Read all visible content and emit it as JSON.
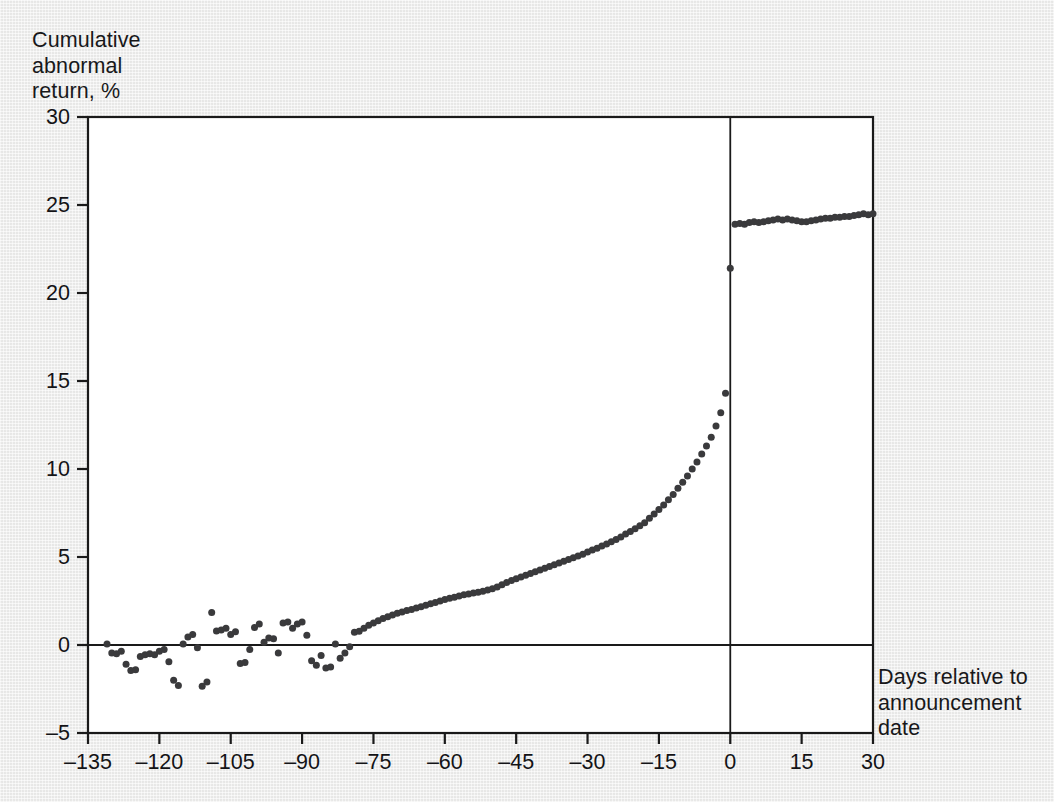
{
  "figure": {
    "background_color": "#ededec",
    "ink_color": "#1a1a1a",
    "marker_color": "#3a3a3c"
  },
  "chart_data": {
    "type": "scatter",
    "title": "",
    "subtitle": "",
    "xlabel": "Days relative to announcement date",
    "ylabel": "Cumulative abnormal return, %",
    "xlim": [
      -135,
      30
    ],
    "ylim": [
      -5,
      30
    ],
    "xticks": [
      -135,
      -120,
      -105,
      -90,
      -75,
      -60,
      -45,
      -30,
      -15,
      0,
      15,
      30
    ],
    "xtick_labels": [
      "–135",
      "–120",
      "–105",
      "–90",
      "–75",
      "–60",
      "–45",
      "–30",
      "–15",
      "0",
      "15",
      "30"
    ],
    "yticks": [
      -5,
      0,
      5,
      10,
      15,
      20,
      25,
      30
    ],
    "ytick_labels": [
      "–5",
      "0",
      "5",
      "10",
      "15",
      "20",
      "25",
      "30"
    ],
    "grid": false,
    "legend": null,
    "legend_position": "none",
    "annotations": [
      {
        "name": "zero-day-rule",
        "type": "vline",
        "x": 0
      },
      {
        "name": "zero-return-rule",
        "type": "hline",
        "y": 0
      }
    ],
    "marker_size_px": 7,
    "series": [
      {
        "name": "Cumulative abnormal return",
        "points": [
          [
            -131,
            0.05
          ],
          [
            -130,
            -0.45
          ],
          [
            -129,
            -0.5
          ],
          [
            -128,
            -0.35
          ],
          [
            -127,
            -1.1
          ],
          [
            -126,
            -1.45
          ],
          [
            -125,
            -1.4
          ],
          [
            -124,
            -0.65
          ],
          [
            -123,
            -0.55
          ],
          [
            -122,
            -0.5
          ],
          [
            -121,
            -0.55
          ],
          [
            -120,
            -0.35
          ],
          [
            -119,
            -0.25
          ],
          [
            -118,
            -0.95
          ],
          [
            -117,
            -2.0
          ],
          [
            -116,
            -2.3
          ],
          [
            -115,
            0.05
          ],
          [
            -114,
            0.45
          ],
          [
            -113,
            0.6
          ],
          [
            -112,
            -0.15
          ],
          [
            -111,
            -2.35
          ],
          [
            -110,
            -2.1
          ],
          [
            -109,
            1.85
          ],
          [
            -108,
            0.8
          ],
          [
            -107,
            0.85
          ],
          [
            -106,
            0.95
          ],
          [
            -105,
            0.6
          ],
          [
            -104,
            0.75
          ],
          [
            -103,
            -1.05
          ],
          [
            -102,
            -1.0
          ],
          [
            -101,
            -0.25
          ],
          [
            -100,
            1.0
          ],
          [
            -99,
            1.2
          ],
          [
            -98,
            0.15
          ],
          [
            -97,
            0.4
          ],
          [
            -96,
            0.35
          ],
          [
            -95,
            -0.45
          ],
          [
            -94,
            1.25
          ],
          [
            -93,
            1.3
          ],
          [
            -92,
            0.95
          ],
          [
            -91,
            1.2
          ],
          [
            -90,
            1.3
          ],
          [
            -89,
            0.55
          ],
          [
            -88,
            -0.9
          ],
          [
            -87,
            -1.15
          ],
          [
            -86,
            -0.6
          ],
          [
            -85,
            -1.3
          ],
          [
            -84,
            -1.25
          ],
          [
            -83,
            0.05
          ],
          [
            -82,
            -0.75
          ],
          [
            -81,
            -0.45
          ],
          [
            -80,
            -0.1
          ],
          [
            -79,
            0.72
          ],
          [
            -78,
            0.78
          ],
          [
            -77,
            0.95
          ],
          [
            -76,
            1.12
          ],
          [
            -75,
            1.25
          ],
          [
            -74,
            1.38
          ],
          [
            -73,
            1.5
          ],
          [
            -72,
            1.6
          ],
          [
            -71,
            1.7
          ],
          [
            -70,
            1.8
          ],
          [
            -69,
            1.88
          ],
          [
            -68,
            1.96
          ],
          [
            -67,
            2.02
          ],
          [
            -66,
            2.1
          ],
          [
            -65,
            2.18
          ],
          [
            -64,
            2.26
          ],
          [
            -63,
            2.34
          ],
          [
            -62,
            2.42
          ],
          [
            -61,
            2.5
          ],
          [
            -60,
            2.58
          ],
          [
            -59,
            2.66
          ],
          [
            -58,
            2.72
          ],
          [
            -57,
            2.78
          ],
          [
            -56,
            2.85
          ],
          [
            -55,
            2.9
          ],
          [
            -54,
            2.95
          ],
          [
            -53,
            3.0
          ],
          [
            -52,
            3.05
          ],
          [
            -51,
            3.12
          ],
          [
            -50,
            3.2
          ],
          [
            -49,
            3.3
          ],
          [
            -48,
            3.42
          ],
          [
            -47,
            3.55
          ],
          [
            -46,
            3.66
          ],
          [
            -45,
            3.76
          ],
          [
            -44,
            3.86
          ],
          [
            -43,
            3.96
          ],
          [
            -42,
            4.06
          ],
          [
            -41,
            4.16
          ],
          [
            -40,
            4.26
          ],
          [
            -39,
            4.36
          ],
          [
            -38,
            4.46
          ],
          [
            -37,
            4.56
          ],
          [
            -36,
            4.66
          ],
          [
            -35,
            4.76
          ],
          [
            -34,
            4.86
          ],
          [
            -33,
            4.96
          ],
          [
            -32,
            5.06
          ],
          [
            -31,
            5.16
          ],
          [
            -30,
            5.28
          ],
          [
            -29,
            5.4
          ],
          [
            -28,
            5.5
          ],
          [
            -27,
            5.62
          ],
          [
            -26,
            5.74
          ],
          [
            -25,
            5.86
          ],
          [
            -24,
            6.0
          ],
          [
            -23,
            6.14
          ],
          [
            -22,
            6.3
          ],
          [
            -21,
            6.45
          ],
          [
            -20,
            6.6
          ],
          [
            -19,
            6.78
          ],
          [
            -18,
            6.95
          ],
          [
            -17,
            7.2
          ],
          [
            -16,
            7.45
          ],
          [
            -15,
            7.7
          ],
          [
            -14,
            7.95
          ],
          [
            -13,
            8.25
          ],
          [
            -12,
            8.55
          ],
          [
            -11,
            8.9
          ],
          [
            -10,
            9.25
          ],
          [
            -9,
            9.6
          ],
          [
            -8,
            10.0
          ],
          [
            -7,
            10.4
          ],
          [
            -6,
            10.85
          ],
          [
            -5,
            11.3
          ],
          [
            -4,
            11.8
          ],
          [
            -3,
            12.45
          ],
          [
            -2,
            13.2
          ],
          [
            -1,
            14.3
          ],
          [
            0,
            21.4
          ],
          [
            1,
            23.9
          ],
          [
            2,
            23.95
          ],
          [
            3,
            23.9
          ],
          [
            4,
            24.0
          ],
          [
            5,
            24.05
          ],
          [
            6,
            24.0
          ],
          [
            7,
            24.05
          ],
          [
            8,
            24.1
          ],
          [
            9,
            24.15
          ],
          [
            10,
            24.2
          ],
          [
            11,
            24.15
          ],
          [
            12,
            24.2
          ],
          [
            13,
            24.15
          ],
          [
            14,
            24.1
          ],
          [
            15,
            24.05
          ],
          [
            16,
            24.05
          ],
          [
            17,
            24.1
          ],
          [
            18,
            24.15
          ],
          [
            19,
            24.2
          ],
          [
            20,
            24.25
          ],
          [
            21,
            24.25
          ],
          [
            22,
            24.3
          ],
          [
            23,
            24.3
          ],
          [
            24,
            24.35
          ],
          [
            25,
            24.35
          ],
          [
            26,
            24.4
          ],
          [
            27,
            24.45
          ],
          [
            28,
            24.5
          ],
          [
            29,
            24.45
          ],
          [
            30,
            24.5
          ]
        ]
      }
    ]
  }
}
